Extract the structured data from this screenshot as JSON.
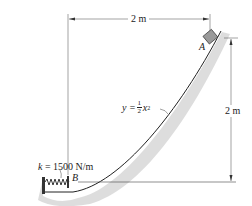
{
  "diagram": {
    "type": "physics-mechanics",
    "labels": {
      "point_a": "A",
      "point_b": "B",
      "spring_constant": "k = 1500 N/m",
      "spring_k_var": "k",
      "spring_k_value": " = 1500 N/m",
      "curve_eq_lhs": "y =",
      "curve_eq_num": "1",
      "curve_eq_den": "2",
      "curve_eq_var": "x",
      "curve_eq_exp": "2",
      "horizontal_dim": "2 m",
      "vertical_dim": "2 m"
    },
    "colors": {
      "line": "#222222",
      "block": "#9a9a9a",
      "shadow": "#d0d0d0"
    }
  }
}
